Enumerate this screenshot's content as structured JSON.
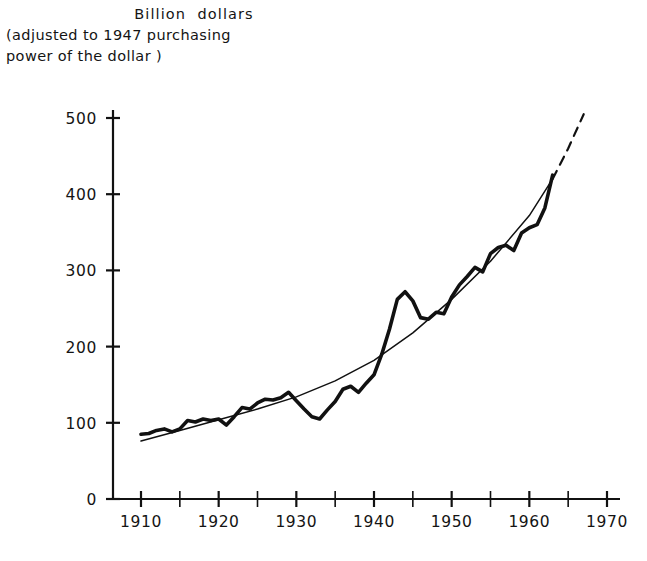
{
  "figure": {
    "title_line1": "Billion  dollars",
    "title_line2": "(adjusted to 1947 purchasing",
    "title_line3": "power of the dollar )",
    "bottom_caption": ""
  },
  "chart_data": {
    "type": "line",
    "xlabel": "",
    "ylabel": "Billion dollars",
    "xlim": [
      1908,
      1972
    ],
    "ylim": [
      0,
      520
    ],
    "yticks": [
      0,
      100,
      200,
      300,
      400,
      500
    ],
    "ytick_labels": [
      "0",
      "100",
      "200",
      "300",
      "400",
      "500"
    ],
    "xticks": [
      1910,
      1920,
      1930,
      1940,
      1950,
      1960,
      1970
    ],
    "xtick_labels": [
      "1910",
      "1920",
      "1930",
      "1940",
      "1950",
      "1960",
      "1970"
    ],
    "x_minor_ticks": [
      1915,
      1925,
      1935,
      1945,
      1955,
      1965
    ],
    "grid": false,
    "legend": null,
    "series": [
      {
        "name": "Actual",
        "style": "solid-heavy",
        "x": [
          1910,
          1911,
          1912,
          1913,
          1914,
          1915,
          1916,
          1917,
          1918,
          1919,
          1920,
          1921,
          1922,
          1923,
          1924,
          1925,
          1926,
          1927,
          1928,
          1929,
          1930,
          1931,
          1932,
          1933,
          1934,
          1935,
          1936,
          1937,
          1938,
          1939,
          1940,
          1941,
          1942,
          1943,
          1944,
          1945,
          1946,
          1947,
          1948,
          1949,
          1950,
          1951,
          1952,
          1953,
          1954,
          1955,
          1956,
          1957,
          1958,
          1959,
          1960,
          1961,
          1962,
          1963
        ],
        "values": [
          85,
          86,
          90,
          92,
          88,
          92,
          103,
          101,
          105,
          103,
          105,
          97,
          108,
          120,
          118,
          126,
          131,
          130,
          133,
          140,
          129,
          118,
          108,
          105,
          117,
          128,
          144,
          148,
          140,
          152,
          163,
          190,
          223,
          262,
          272,
          260,
          238,
          236,
          245,
          243,
          265,
          281,
          292,
          304,
          298,
          322,
          330,
          333,
          326,
          349,
          356,
          360,
          382,
          425
        ],
        "units": "billion dollars (1947 purchasing power)"
      },
      {
        "name": "Trend",
        "style": "solid-thin",
        "x": [
          1910,
          1915,
          1920,
          1925,
          1930,
          1935,
          1940,
          1945,
          1950,
          1955,
          1960,
          1963
        ],
        "values": [
          76,
          90,
          104,
          118,
          134,
          155,
          182,
          218,
          262,
          312,
          372,
          420
        ]
      },
      {
        "name": "Trend projection",
        "style": "dashed-thin",
        "x": [
          1963,
          1965,
          1967
        ],
        "values": [
          420,
          460,
          505
        ]
      }
    ],
    "annotations": []
  }
}
